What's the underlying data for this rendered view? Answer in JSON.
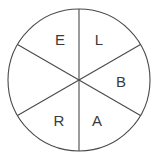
{
  "figure": {
    "name": "six-sector-spinner-wheel",
    "shape": "circle",
    "background_color": "#ffffff",
    "stroke_color": "#4a4a4a",
    "label_color": "#3a3a3a",
    "center": {
      "x": 79,
      "y": 80
    },
    "radius": 71,
    "sector_count": 6,
    "sector_angle_degrees": 60
  },
  "sectors": [
    {
      "id": "sector-top-left",
      "label": "E",
      "label_x": 60,
      "label_y": 41,
      "start_angle": 180,
      "end_angle": 240
    },
    {
      "id": "sector-top-right",
      "label": "L",
      "label_x": 99,
      "label_y": 41,
      "start_angle": 240,
      "end_angle": 300
    },
    {
      "id": "sector-right",
      "label": "B",
      "label_x": 121,
      "label_y": 83,
      "start_angle": 300,
      "end_angle": 0
    },
    {
      "id": "sector-bottom-right",
      "label": "A",
      "label_x": 97,
      "label_y": 122,
      "start_angle": 0,
      "end_angle": 60
    },
    {
      "id": "sector-bottom-left",
      "label": "R",
      "label_x": 59,
      "label_y": 122,
      "start_angle": 60,
      "end_angle": 120
    },
    {
      "id": "sector-left",
      "label": "",
      "label_x": 37,
      "label_y": 83,
      "start_angle": 120,
      "end_angle": 180
    }
  ],
  "dividers": [
    {
      "id": "divider-vertical",
      "x1": 79,
      "y1": 9,
      "x2": 79,
      "y2": 151
    },
    {
      "id": "divider-diagonal-a",
      "x1": 17.5,
      "y1": 44.5,
      "x2": 140.5,
      "y2": 115.5
    },
    {
      "id": "divider-diagonal-b",
      "x1": 17.5,
      "y1": 115.5,
      "x2": 140.5,
      "y2": 44.5
    }
  ]
}
